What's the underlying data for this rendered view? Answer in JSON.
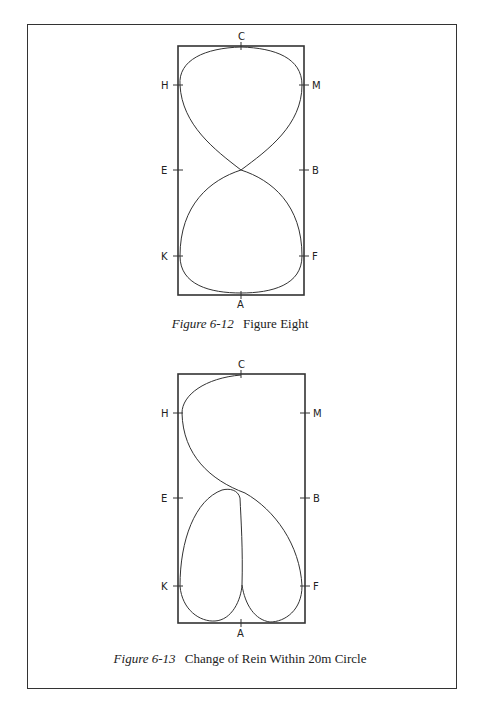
{
  "figures": [
    {
      "number": "Figure 6-12",
      "title": "Figure Eight",
      "arena": {
        "x": 178,
        "y": 46,
        "w": 126,
        "h": 249
      },
      "letters": {
        "top": "C",
        "bottom": "A",
        "left": [
          "H",
          "E",
          "K"
        ],
        "right": [
          "M",
          "B",
          "F"
        ]
      }
    },
    {
      "number": "Figure 6-13",
      "title": "Change of Rein Within 20m Circle",
      "arena": {
        "x": 178,
        "y": 374,
        "w": 127,
        "h": 249
      },
      "letters": {
        "top": "C",
        "bottom": "A",
        "left": [
          "H",
          "E",
          "K"
        ],
        "right": [
          "M",
          "B",
          "F"
        ]
      }
    }
  ]
}
